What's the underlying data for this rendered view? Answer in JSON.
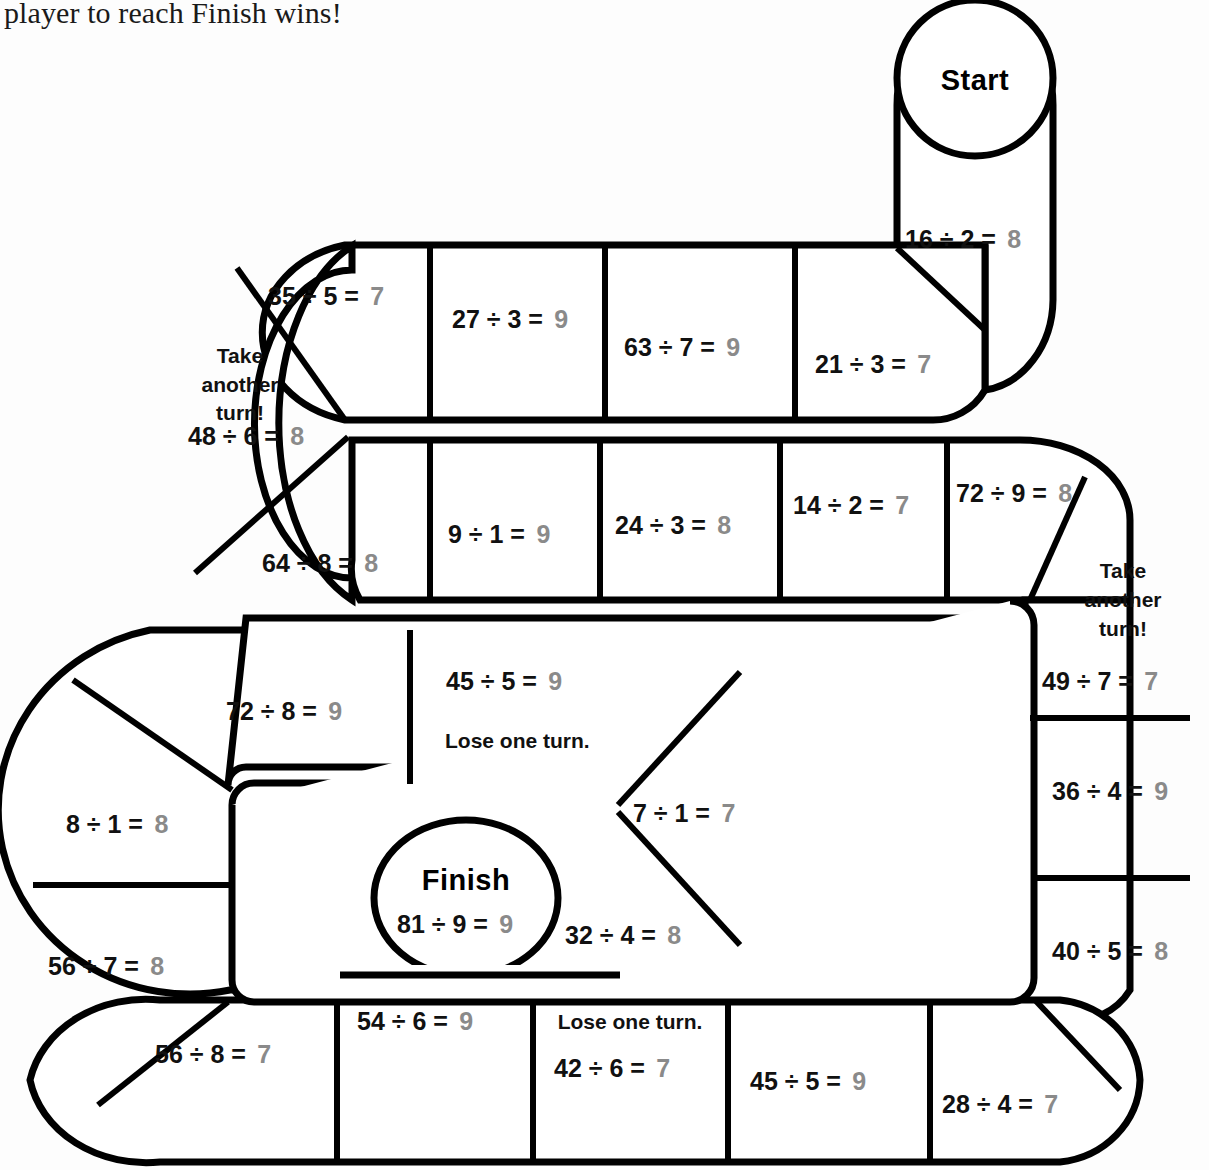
{
  "page": {
    "intro_text": "player to reach Finish wins!",
    "answer_color": "#8a8a8a",
    "equation_color": "#111111",
    "line_color": "#000000",
    "board_fill": "#ffffff",
    "background": "#fdfdfd"
  },
  "labels": {
    "start": "Start",
    "finish": "Finish",
    "take_another_turn": "Take another turn!",
    "take_word_1": "Take",
    "take_word_2": "another",
    "take_word_3": "turn!",
    "lose_one_turn": "Lose one turn."
  },
  "board": {
    "type": "board-game-track",
    "spaces": [
      {
        "id": "start",
        "label": "Start",
        "equation": "",
        "answer": "",
        "note": ""
      },
      {
        "id": "s01",
        "equation": "16 ÷ 2 =",
        "answer": "8",
        "note": ""
      },
      {
        "id": "s02",
        "equation": "21 ÷ 3 =",
        "answer": "7",
        "note": ""
      },
      {
        "id": "s03",
        "equation": "63 ÷ 7 =",
        "answer": "9",
        "note": ""
      },
      {
        "id": "s04",
        "equation": "27 ÷ 3 =",
        "answer": "9",
        "note": ""
      },
      {
        "id": "s05",
        "equation": "35 ÷ 5 =",
        "answer": "7",
        "note": ""
      },
      {
        "id": "s06",
        "equation": "48 ÷ 6 =",
        "answer": "8",
        "note": "Take another turn!"
      },
      {
        "id": "s07",
        "equation": "64 ÷ 8 =",
        "answer": "8",
        "note": ""
      },
      {
        "id": "s08",
        "equation": "9 ÷ 1 =",
        "answer": "9",
        "note": ""
      },
      {
        "id": "s09",
        "equation": "24 ÷ 3 =",
        "answer": "8",
        "note": ""
      },
      {
        "id": "s10",
        "equation": "14 ÷ 2 =",
        "answer": "7",
        "note": ""
      },
      {
        "id": "s11",
        "equation": "72 ÷ 9 =",
        "answer": "8",
        "note": ""
      },
      {
        "id": "s12",
        "equation": "49 ÷ 7 =",
        "answer": "7",
        "note": "Take another turn!"
      },
      {
        "id": "s13",
        "equation": "36 ÷ 4 =",
        "answer": "9",
        "note": ""
      },
      {
        "id": "s14",
        "equation": "40 ÷ 5 =",
        "answer": "8",
        "note": ""
      },
      {
        "id": "s15",
        "equation": "28 ÷ 4 =",
        "answer": "7",
        "note": ""
      },
      {
        "id": "s16",
        "equation": "45 ÷ 5 =",
        "answer": "9",
        "note": ""
      },
      {
        "id": "s17",
        "equation": "42 ÷ 6 =",
        "answer": "7",
        "note": "Lose one turn."
      },
      {
        "id": "s18",
        "equation": "54  ÷ 6 =",
        "answer": "9",
        "note": ""
      },
      {
        "id": "s19",
        "equation": "56 ÷ 8 =",
        "answer": "7",
        "note": ""
      },
      {
        "id": "s20",
        "equation": "56 ÷ 7 =",
        "answer": "8",
        "note": ""
      },
      {
        "id": "s21",
        "equation": "8 ÷ 1 =",
        "answer": "8",
        "note": ""
      },
      {
        "id": "s22",
        "equation": "72 ÷ 8 =",
        "answer": "9",
        "note": ""
      },
      {
        "id": "s23",
        "equation": "45 ÷ 5 =",
        "answer": "9",
        "note": "Lose one turn."
      },
      {
        "id": "s24",
        "equation": "7 ÷ 1 =",
        "answer": "7",
        "note": ""
      },
      {
        "id": "s25",
        "equation": "32 ÷ 4 =",
        "answer": "8",
        "note": ""
      },
      {
        "id": "finish",
        "label": "Finish",
        "equation": "81 ÷ 9 =",
        "answer": "9",
        "note": ""
      }
    ]
  },
  "cells": {
    "start_label": "Start",
    "finish_label": "Finish",
    "r1": {
      "c16_2_eq": "16 ÷ 2 =",
      "c16_2_ans": "8",
      "c21_3_eq": "21 ÷ 3 =",
      "c21_3_ans": "7",
      "c63_7_eq": "63 ÷ 7 =",
      "c63_7_ans": "9",
      "c27_3_eq": "27 ÷ 3 =",
      "c27_3_ans": "9",
      "c35_5_eq": "35 ÷ 5 =",
      "c35_5_ans": "7",
      "c48_6_eq": "48 ÷ 6 =",
      "c48_6_ans": "8"
    },
    "r2": {
      "c64_8_eq": "64 ÷ 8 =",
      "c64_8_ans": "8",
      "c9_1_eq": "9 ÷ 1 =",
      "c9_1_ans": "9",
      "c24_3_eq": "24 ÷ 3 =",
      "c24_3_ans": "8",
      "c14_2_eq": "14 ÷ 2 =",
      "c14_2_ans": "7",
      "c72_9_eq": "72 ÷ 9 =",
      "c72_9_ans": "8",
      "c49_7_eq": "49 ÷ 7 =",
      "c49_7_ans": "7"
    },
    "right": {
      "c36_4_eq": "36 ÷ 4 =",
      "c36_4_ans": "9",
      "c40_5_eq": "40 ÷ 5 =",
      "c40_5_ans": "8"
    },
    "r3": {
      "c72_8_eq": "72 ÷ 8 =",
      "c72_8_ans": "9",
      "c45_5_eq": "45 ÷ 5 =",
      "c45_5_ans": "9",
      "c7_1_eq": "7 ÷ 1 =",
      "c7_1_ans": "7",
      "c32_4_eq": "32 ÷ 4 =",
      "c32_4_ans": "8",
      "c81_9_eq": "81 ÷ 9 =",
      "c81_9_ans": "9"
    },
    "left": {
      "c8_1_eq": "8 ÷ 1 =",
      "c8_1_ans": "8",
      "c56_7_eq": "56 ÷ 7 =",
      "c56_7_ans": "8"
    },
    "r4": {
      "c56_8_eq": "56 ÷ 8 =",
      "c56_8_ans": "7",
      "c54_6_eq": "54  ÷ 6 =",
      "c54_6_ans": "9",
      "c42_6_eq": "42 ÷ 6 =",
      "c42_6_ans": "7",
      "c45_5b_eq": "45 ÷ 5 =",
      "c45_5b_ans": "9",
      "c28_4_eq": "28 ÷ 4 =",
      "c28_4_ans": "7"
    }
  }
}
